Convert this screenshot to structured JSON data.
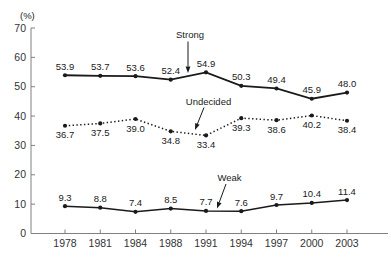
{
  "figure": {
    "y_axis_unit": "(%)"
  },
  "chart_data": {
    "type": "line",
    "title": "",
    "xlabel": "",
    "ylabel": "(%)",
    "ylim": [
      0,
      70
    ],
    "yticks": [
      0,
      10,
      20,
      30,
      40,
      50,
      60,
      70
    ],
    "grid": false,
    "legend_position": "inline-annotations-with-arrows",
    "categories": [
      "1978",
      "1981",
      "1984",
      "1988",
      "1991",
      "1994",
      "1997",
      "2000",
      "2003"
    ],
    "series": [
      {
        "name": "Strong",
        "line_style": "solid",
        "marker": "dot",
        "label_position": "above",
        "values": [
          53.9,
          53.7,
          53.6,
          52.4,
          54.9,
          50.3,
          49.4,
          45.9,
          48.0
        ]
      },
      {
        "name": "Undecided",
        "line_style": "dotted",
        "marker": "dot",
        "label_position": "below",
        "values": [
          36.7,
          37.5,
          39.0,
          34.8,
          33.4,
          39.3,
          38.6,
          40.2,
          38.4
        ]
      },
      {
        "name": "Weak",
        "line_style": "solid",
        "marker": "dot",
        "label_position": "above",
        "values": [
          9.3,
          8.8,
          7.4,
          8.5,
          7.7,
          7.6,
          9.7,
          10.4,
          11.4
        ]
      }
    ],
    "colors": {
      "line": "#1a1a1a",
      "marker": "#1a1a1a",
      "axis": "#808080",
      "text": "#1a1a1a"
    }
  }
}
